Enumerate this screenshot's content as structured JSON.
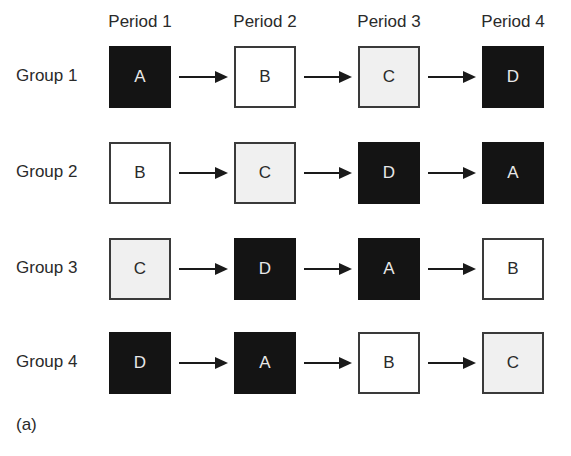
{
  "periods": [
    "Period 1",
    "Period 2",
    "Period 3",
    "Period 4"
  ],
  "groups": [
    {
      "label": "Group 1",
      "cells": [
        {
          "t": "A",
          "fill": "black"
        },
        {
          "t": "B",
          "fill": "white"
        },
        {
          "t": "C",
          "fill": "gray"
        },
        {
          "t": "D",
          "fill": "black"
        }
      ]
    },
    {
      "label": "Group 2",
      "cells": [
        {
          "t": "B",
          "fill": "white"
        },
        {
          "t": "C",
          "fill": "gray"
        },
        {
          "t": "D",
          "fill": "black"
        },
        {
          "t": "A",
          "fill": "black"
        }
      ]
    },
    {
      "label": "Group 3",
      "cells": [
        {
          "t": "C",
          "fill": "gray"
        },
        {
          "t": "D",
          "fill": "black"
        },
        {
          "t": "A",
          "fill": "black"
        },
        {
          "t": "B",
          "fill": "white"
        }
      ]
    },
    {
      "label": "Group 4",
      "cells": [
        {
          "t": "D",
          "fill": "black"
        },
        {
          "t": "A",
          "fill": "black"
        },
        {
          "t": "B",
          "fill": "white"
        },
        {
          "t": "C",
          "fill": "gray"
        }
      ]
    }
  ],
  "panel_label": "(a)",
  "colors": {
    "black": "#141414",
    "white": "#ffffff",
    "gray": "#f0f0f0",
    "arrow": "#1a1a1a"
  }
}
